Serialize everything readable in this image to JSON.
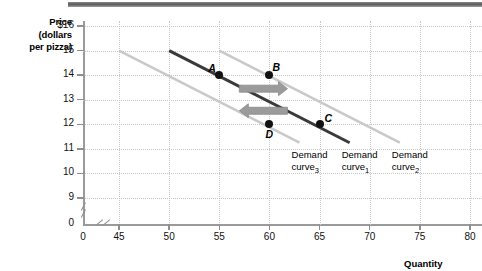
{
  "chart_data": {
    "type": "line",
    "title": "",
    "ylabel": "Price (dollars per pizza)",
    "xlabel": "Quantity",
    "ylim": [
      8.6,
      16
    ],
    "xlim": [
      43.2,
      80
    ],
    "grid": true,
    "y_ticks": [
      "$16",
      "15",
      "14",
      "13",
      "12",
      "11",
      "10",
      "9",
      "0"
    ],
    "y_tick_values": [
      16,
      15,
      14,
      13,
      12,
      11,
      10,
      9,
      0
    ],
    "x_ticks": [
      "0",
      "45",
      "50",
      "55",
      "60",
      "65",
      "70",
      "75",
      "80"
    ],
    "x_tick_values": [
      0,
      45,
      50,
      55,
      60,
      65,
      70,
      75,
      80
    ],
    "axis_break_x": true,
    "axis_break_y": true,
    "series": [
      {
        "name": "Demand curve3",
        "label": "Demand curve",
        "subscript": "3",
        "color": "#c9c9c9",
        "style": "light",
        "points": [
          {
            "x": 45,
            "y": 15
          },
          {
            "x": 63,
            "y": 11.25
          }
        ]
      },
      {
        "name": "Demand curve1",
        "label": "Demand curve",
        "subscript": "1",
        "color": "#3a3a3a",
        "style": "dark",
        "points": [
          {
            "x": 50,
            "y": 15
          },
          {
            "x": 68,
            "y": 11.25
          }
        ]
      },
      {
        "name": "Demand curve2",
        "label": "Demand curve",
        "subscript": "2",
        "color": "#c9c9c9",
        "style": "light",
        "points": [
          {
            "x": 55,
            "y": 15
          },
          {
            "x": 73,
            "y": 11.25
          }
        ]
      }
    ],
    "annotated_points": [
      {
        "label": "A",
        "x": 55,
        "y": 14,
        "label_dx": -11,
        "label_dy": -13
      },
      {
        "label": "B",
        "x": 60,
        "y": 14,
        "label_dx": 3,
        "label_dy": -14
      },
      {
        "label": "C",
        "x": 65,
        "y": 12,
        "label_dx": 5,
        "label_dy": -12
      },
      {
        "label": "D",
        "x": 60,
        "y": 12,
        "label_dx": -4,
        "label_dy": 4
      }
    ],
    "arrows": [
      {
        "name": "shift-right-arrow",
        "direction": "right",
        "from_x": 57.0,
        "to_x": 61.8,
        "y": 13.45
      },
      {
        "name": "shift-left-arrow",
        "direction": "left",
        "from_x": 61.8,
        "to_x": 57.0,
        "y": 12.55
      }
    ],
    "curve_labels": [
      {
        "line1": "Demand",
        "line2": "curve",
        "sub": "3",
        "x": 64.6,
        "y": 10.75
      },
      {
        "line1": "Demand",
        "line2": "curve",
        "sub": "1",
        "x": 69.6,
        "y": 10.75
      },
      {
        "line1": "Demand",
        "line2": "curve",
        "sub": "2",
        "x": 74.6,
        "y": 10.75
      }
    ]
  },
  "axes": {
    "y_title_line1": "Price",
    "y_title_line2": "(dollars",
    "y_title_line3": "per pizza)",
    "x_title": "Quantity"
  }
}
